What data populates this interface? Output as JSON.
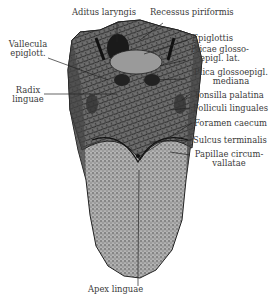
{
  "figure": {
    "labels": {
      "top": [
        {
          "id": "aditus_laryngis",
          "text": "Aditus laryngis"
        },
        {
          "id": "recessus_piriformis",
          "text": "Recessus piriformis"
        }
      ],
      "left": [
        {
          "id": "vallecula_epiglott",
          "lines": [
            "Vallecula",
            "epiglott."
          ]
        },
        {
          "id": "radix_linguae",
          "lines": [
            "Radix",
            "linguae"
          ]
        }
      ],
      "right": [
        {
          "id": "epiglottis",
          "lines": [
            "Epiglottis"
          ]
        },
        {
          "id": "plicae_glossoepigl_lat",
          "lines": [
            "Plicae glosso-",
            "epigl. lat."
          ]
        },
        {
          "id": "plica_glossoepigl_mediana",
          "lines": [
            "Plica glossoepigl.",
            "mediana"
          ]
        },
        {
          "id": "tonsilla_palatina",
          "lines": [
            "Tonsilla palatina"
          ]
        },
        {
          "id": "folliculi_linguales",
          "lines": [
            "Folliculi linguales"
          ]
        },
        {
          "id": "foramen_caecum",
          "lines": [
            "Foramen caecum"
          ]
        },
        {
          "id": "sulcus_terminalis",
          "lines": [
            "Sulcus terminalis"
          ]
        },
        {
          "id": "papillae_circumvallatae",
          "lines": [
            "Papillae circum-",
            "vallatae"
          ]
        }
      ],
      "bottom": [
        {
          "id": "apex_linguae",
          "text": "Apex linguae"
        }
      ]
    },
    "colors": {
      "ink": "#333333",
      "paper": "#ffffff",
      "shade": "#6b6b6b"
    }
  }
}
